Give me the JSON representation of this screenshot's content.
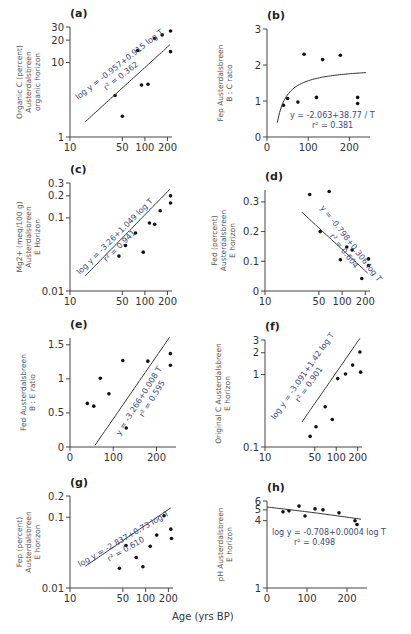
{
  "figure": {
    "x_axis_label": "Age (yrs BP)"
  },
  "chart_data": [
    {
      "panel": "(a)",
      "type": "scatter",
      "ylabel": "Organic C (percent) Austerdalsbreen organic horizon",
      "xscale": "log",
      "yscale": "log",
      "xticks": [
        "10",
        "50",
        "100",
        "200"
      ],
      "yticks": [
        "1",
        "10",
        "20",
        "30"
      ],
      "xlim": [
        10,
        230
      ],
      "ylim": [
        1,
        30
      ],
      "points": [
        [
          40,
          3.6
        ],
        [
          50,
          1.9
        ],
        [
          80,
          14.5
        ],
        [
          90,
          5
        ],
        [
          110,
          5.1
        ],
        [
          135,
          21
        ],
        [
          170,
          23.5
        ],
        [
          220,
          26.5
        ],
        [
          220,
          14
        ]
      ],
      "fit": {
        "type": "log-log",
        "equation": "log y = -0.957+0.915 log T",
        "r2": "r² = 0.362"
      }
    },
    {
      "panel": "(b)",
      "type": "scatter",
      "ylabel": "Fep Austerdalsbreen B : C ratio",
      "xscale": "linear",
      "yscale": "linear",
      "xticks": [
        "0",
        "100",
        "200"
      ],
      "yticks": [
        "0",
        "1",
        "2",
        "3"
      ],
      "xlim": [
        0,
        250
      ],
      "ylim": [
        0,
        3
      ],
      "points": [
        [
          40,
          0.88
        ],
        [
          50,
          1.07
        ],
        [
          75,
          0.97
        ],
        [
          90,
          2.3
        ],
        [
          120,
          1.1
        ],
        [
          135,
          2.15
        ],
        [
          178,
          2.27
        ],
        [
          220,
          1.1
        ],
        [
          220,
          0.93
        ]
      ],
      "fit": {
        "type": "reciprocal",
        "equation": "y = -2.063+38.77 / T",
        "r2": "r² = 0.381"
      }
    },
    {
      "panel": "(c)",
      "type": "scatter",
      "ylabel": "Mg2+ (meq/100 g) Austerdalsbreen E Horizon",
      "xscale": "log",
      "yscale": "log",
      "xticks": [
        "10",
        "50",
        "100",
        "200"
      ],
      "yticks": [
        "0.01",
        "0.1",
        "0.2",
        "0.3"
      ],
      "xlim": [
        10,
        230
      ],
      "ylim": [
        0.01,
        0.3
      ],
      "points": [
        [
          45,
          0.03
        ],
        [
          55,
          0.042
        ],
        [
          75,
          0.062
        ],
        [
          95,
          0.034
        ],
        [
          115,
          0.085
        ],
        [
          135,
          0.082
        ],
        [
          160,
          0.125
        ],
        [
          220,
          0.2
        ],
        [
          220,
          0.16
        ]
      ],
      "fit": {
        "type": "log-log",
        "equation": "log y = -3.26+1.049 log T",
        "r2": "r² = 0.941"
      }
    },
    {
      "panel": "(d)",
      "type": "scatter",
      "ylabel": "Fed (percent) Austerdalsbreen E horizon",
      "xscale": "log",
      "yscale": "linear",
      "xticks": [
        "10",
        "50",
        "100",
        "200"
      ],
      "yticks": [
        "0",
        "0.1",
        "0.2",
        "0.3"
      ],
      "xlim": [
        10,
        230
      ],
      "ylim": [
        0,
        0.34
      ],
      "points": [
        [
          38,
          0.325
        ],
        [
          52,
          0.2
        ],
        [
          68,
          0.335
        ],
        [
          95,
          0.105
        ],
        [
          115,
          0.148
        ],
        [
          135,
          0.138
        ],
        [
          180,
          0.042
        ],
        [
          220,
          0.108
        ],
        [
          220,
          0.086
        ]
      ],
      "fit": {
        "type": "semi-log",
        "equation": "y = -0.798+0.306 log T",
        "r2": "r² = 0.604"
      }
    },
    {
      "panel": "(e)",
      "type": "scatter",
      "ylabel": "Fed Austerdalsbreen B : E ratio",
      "xscale": "linear",
      "yscale": "linear",
      "xticks": [
        "0",
        "100",
        "200"
      ],
      "yticks": [
        "0",
        "0.5",
        "1",
        "1.5"
      ],
      "xlim": [
        0,
        245
      ],
      "ylim": [
        0,
        1.6
      ],
      "points": [
        [
          40,
          0.64
        ],
        [
          55,
          0.6
        ],
        [
          70,
          1.01
        ],
        [
          90,
          0.78
        ],
        [
          122,
          1.27
        ],
        [
          130,
          0.28
        ],
        [
          180,
          1.26
        ],
        [
          232,
          1.37
        ],
        [
          232,
          1.2
        ]
      ],
      "fit": {
        "type": "linear",
        "equation": "y = -3.266+0.008 T",
        "r2": "r² = 0.595"
      }
    },
    {
      "panel": "(f)",
      "type": "scatter",
      "ylabel": "Original C Austerdalsbreen E horizon",
      "xscale": "log",
      "yscale": "log",
      "xticks": [
        "10",
        "50",
        "100",
        "200"
      ],
      "yticks": [
        "0.1",
        "1",
        "2",
        "3"
      ],
      "xlim": [
        10,
        230
      ],
      "ylim": [
        0.1,
        3
      ],
      "points": [
        [
          43,
          0.14
        ],
        [
          52,
          0.19
        ],
        [
          70,
          0.36
        ],
        [
          88,
          0.24
        ],
        [
          105,
          0.88
        ],
        [
          135,
          1.02
        ],
        [
          170,
          1.35
        ],
        [
          215,
          2.05
        ],
        [
          220,
          1.08
        ]
      ],
      "fit": {
        "type": "log-log",
        "equation": "log y = -3.091+1.42 log T",
        "r2": "r² = 0.901"
      }
    },
    {
      "panel": "(g)",
      "type": "scatter",
      "ylabel": "Fep (percent) Austerdalsbreen E horizon",
      "xscale": "log",
      "yscale": "log",
      "xticks": [
        "10",
        "50",
        "100",
        "200"
      ],
      "yticks": [
        "0.01",
        "0.1",
        "0.2"
      ],
      "xlim": [
        10,
        230
      ],
      "ylim": [
        0.01,
        0.2
      ],
      "points": [
        [
          45,
          0.019
        ],
        [
          55,
          0.04
        ],
        [
          75,
          0.027
        ],
        [
          92,
          0.02
        ],
        [
          115,
          0.039
        ],
        [
          140,
          0.056
        ],
        [
          175,
          0.105
        ],
        [
          215,
          0.068
        ],
        [
          220,
          0.05
        ]
      ],
      "fit": {
        "type": "log-log",
        "equation": "log y = -2.837+0.73 log T",
        "r2": "r² = 0.610"
      }
    },
    {
      "panel": "(h)",
      "type": "scatter",
      "ylabel": "pH Austerdalsbreen E horizon",
      "xscale": "linear",
      "yscale": "log",
      "xticks": [
        "0",
        "100",
        "200"
      ],
      "yticks": [
        "1",
        "4",
        "5",
        "6"
      ],
      "xlim": [
        0,
        250
      ],
      "ylim": [
        1,
        6
      ],
      "points": [
        [
          40,
          4.8
        ],
        [
          55,
          4.9
        ],
        [
          80,
          5.4
        ],
        [
          95,
          4.4
        ],
        [
          120,
          5.1
        ],
        [
          140,
          5.0
        ],
        [
          180,
          4.7
        ],
        [
          220,
          4.0
        ],
        [
          225,
          3.7
        ]
      ],
      "fit": {
        "type": "semi-log",
        "equation": "log y = -0.708+0.0004 log T",
        "r2": "r² = 0.498"
      }
    }
  ]
}
